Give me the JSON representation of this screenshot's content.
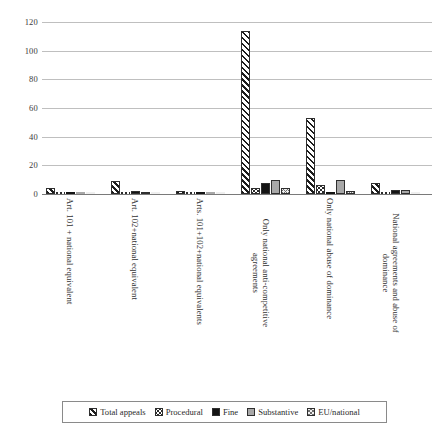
{
  "chart_data": {
    "type": "bar",
    "title": "",
    "xlabel": "",
    "ylabel": "",
    "ylim": [
      0,
      120
    ],
    "yticks": [
      "0",
      "20",
      "40",
      "60",
      "80",
      "100",
      "120"
    ],
    "grid": true,
    "legend_position": "bottom",
    "categories": [
      "Art. 101 + national equivalent",
      "Art. 102+national equivalent",
      "Arts. 101+102+national equivalents",
      "Only national anti-competitive agreements",
      "Only national abuse of dominance",
      "National agreements and abuse of dominance"
    ],
    "series": [
      {
        "name": "Total appeals",
        "key": "s-total",
        "values": [
          4,
          9,
          2,
          114,
          53,
          8
        ]
      },
      {
        "name": "Procedural",
        "key": "s-procedural",
        "values": [
          0,
          0,
          0,
          4,
          6,
          0
        ]
      },
      {
        "name": "Fine",
        "key": "s-fine",
        "values": [
          0,
          2,
          0,
          8,
          0,
          3
        ]
      },
      {
        "name": "Substantive",
        "key": "s-substantive",
        "values": [
          0,
          1,
          0,
          10,
          10,
          3
        ]
      },
      {
        "name": "EU/national",
        "key": "s-eunational",
        "values": [
          0,
          0,
          0,
          4,
          2,
          0
        ]
      }
    ]
  },
  "legend": {
    "items": [
      {
        "label": "Total appeals",
        "key": "s-total"
      },
      {
        "label": "Procedural",
        "key": "s-procedural"
      },
      {
        "label": "Fine",
        "key": "s-fine"
      },
      {
        "label": "Substantive",
        "key": "s-substantive"
      },
      {
        "label": "EU/national",
        "key": "s-eunational"
      }
    ]
  }
}
